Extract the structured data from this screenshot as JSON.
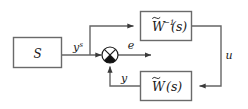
{
  "diagram": {
    "type": "control-block-diagram",
    "background_color": "#ffffff",
    "line_color": "#555555",
    "text_color": "#1a1a1a",
    "blocks": [
      {
        "id": "plant",
        "name": "plant-block",
        "label": "S",
        "label_plain": "S",
        "x": 13,
        "y": 37,
        "w": 49,
        "h": 31
      },
      {
        "id": "w-inverse",
        "name": "w-inverse-block",
        "label": "W̃⁻¹(s)",
        "label_base": "W",
        "label_accent": "tilde",
        "label_exponent": "−1",
        "label_arg": "(s)",
        "x": 140,
        "y": 11,
        "w": 52,
        "h": 30
      },
      {
        "id": "w-forward",
        "name": "w-block",
        "label": "W̃(s)",
        "label_base": "W",
        "label_accent": "tilde",
        "label_arg": "(s)",
        "x": 140,
        "y": 71,
        "w": 52,
        "h": 30
      }
    ],
    "summing_junction": {
      "name": "summing-junction",
      "cx": 110,
      "cy": 55,
      "r": 8,
      "style": "crossed-circle-filled-bottom",
      "filled_quadrants": [
        "bottom"
      ]
    },
    "signals": [
      {
        "id": "ys",
        "name": "signal-label-ys",
        "label": "yˢ",
        "base": "y",
        "superscript": "s",
        "x": 77,
        "y": 48
      },
      {
        "id": "e",
        "name": "signal-label-e",
        "label": "e",
        "base": "e",
        "superscript": "",
        "x": 130,
        "y": 48
      },
      {
        "id": "u",
        "name": "signal-label-u",
        "label": "u",
        "base": "u",
        "superscript": "",
        "x": 227,
        "y": 58
      },
      {
        "id": "y",
        "name": "signal-label-y",
        "label": "y",
        "base": "y",
        "superscript": "",
        "x": 121,
        "y": 80
      }
    ],
    "connections": [
      {
        "name": "wire-plant-to-sum",
        "from": "plant",
        "to": "summing-junction",
        "arrow": true
      },
      {
        "name": "wire-branch-to-w-inverse",
        "from": "ys-node",
        "to": "w-inverse",
        "arrow": true
      },
      {
        "name": "wire-w-inverse-to-w",
        "from": "w-inverse",
        "to": "w-forward",
        "arrow": true
      },
      {
        "name": "wire-w-to-sum",
        "from": "w-forward",
        "to": "summing-junction",
        "arrow": true
      },
      {
        "name": "wire-sum-to-output",
        "from": "summing-junction",
        "to": "e-output",
        "arrow": true
      }
    ]
  }
}
